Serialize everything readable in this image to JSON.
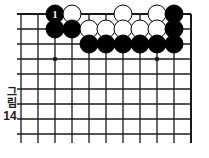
{
  "figure": {
    "caption_hangul": "그림",
    "caption_number": "14",
    "type": "go-board-diagram"
  },
  "colors": {
    "line": "#1a1a1a",
    "black_stone": "#000000",
    "white_stone": "#ffffff",
    "stone_outline": "#000000",
    "background": "#ffffff"
  },
  "board": {
    "columns": 11,
    "rows": 9,
    "left": 21,
    "top": 14,
    "cell_w": 17,
    "cell_h": 15,
    "star_points": [
      {
        "col": 3,
        "row": 4
      },
      {
        "col": 9,
        "row": 4
      }
    ],
    "edges": {
      "top_is_board_edge": true,
      "right_is_board_edge": true,
      "bottom_is_board_edge": false,
      "left_is_board_edge": false
    }
  },
  "stones": [
    {
      "col": 3,
      "row": 1,
      "color": "black",
      "label": "1"
    },
    {
      "col": 4,
      "row": 1,
      "color": "white",
      "label": ""
    },
    {
      "col": 7,
      "row": 1,
      "color": "white",
      "label": ""
    },
    {
      "col": 9,
      "row": 1,
      "color": "white",
      "label": ""
    },
    {
      "col": 10,
      "row": 1,
      "color": "black",
      "label": ""
    },
    {
      "col": 3,
      "row": 2,
      "color": "black",
      "label": ""
    },
    {
      "col": 4,
      "row": 2,
      "color": "black",
      "label": ""
    },
    {
      "col": 5,
      "row": 2,
      "color": "white",
      "label": ""
    },
    {
      "col": 6,
      "row": 2,
      "color": "white",
      "label": ""
    },
    {
      "col": 7,
      "row": 2,
      "color": "white",
      "label": ""
    },
    {
      "col": 8,
      "row": 2,
      "color": "white",
      "label": ""
    },
    {
      "col": 9,
      "row": 2,
      "color": "white",
      "label": ""
    },
    {
      "col": 10,
      "row": 2,
      "color": "black",
      "label": ""
    },
    {
      "col": 5,
      "row": 3,
      "color": "black",
      "label": ""
    },
    {
      "col": 6,
      "row": 3,
      "color": "black",
      "label": ""
    },
    {
      "col": 7,
      "row": 3,
      "color": "black",
      "label": ""
    },
    {
      "col": 8,
      "row": 3,
      "color": "black",
      "label": ""
    },
    {
      "col": 9,
      "row": 3,
      "color": "black",
      "label": ""
    },
    {
      "col": 10,
      "row": 3,
      "color": "black",
      "label": ""
    }
  ]
}
